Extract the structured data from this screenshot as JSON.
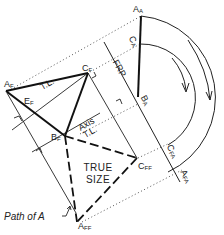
{
  "diagram": {
    "type": "descriptive-geometry-true-size-rotation",
    "labels": {
      "a_f": {
        "main": "A",
        "sub": "F"
      },
      "c_f": {
        "main": "C",
        "sub": "F"
      },
      "b_f": {
        "main": "B",
        "sub": "F"
      },
      "e_f": {
        "main": "E",
        "sub": "F"
      },
      "a_a": {
        "main": "A",
        "sub": "A"
      },
      "c_a": {
        "main": "C",
        "sub": "A"
      },
      "b_a": {
        "main": "B",
        "sub": "A"
      },
      "c_fa": {
        "main": "C",
        "sub": "FA"
      },
      "a_fa": {
        "main": "A",
        "sub": "FA"
      },
      "c_ff": {
        "main": "C",
        "sub": "FF"
      },
      "a_ff": {
        "main": "A",
        "sub": "FF"
      },
      "tl_1": "T.L.",
      "tl_2": "T.L.",
      "axis": "Axis",
      "frp": "FRP",
      "true_size_1": "TRUE",
      "true_size_2": "SIZE",
      "path_of_a": "Path of A"
    },
    "colors": {
      "line": "#111111",
      "dotted": "#555555"
    }
  }
}
